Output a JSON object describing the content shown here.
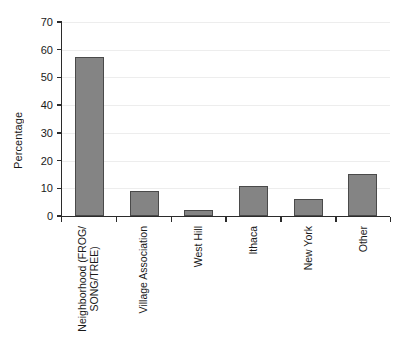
{
  "chart_data": {
    "type": "bar",
    "title": "",
    "xlabel": "",
    "ylabel": "Percentage",
    "ylim": [
      0,
      70
    ],
    "yticks": [
      0,
      10,
      20,
      30,
      40,
      50,
      60,
      70
    ],
    "grid": true,
    "legend": false,
    "bar_color": "#848484",
    "bar_edge_color": "#4a4a4a",
    "categories": [
      "Neighborhood (FROG/\nSONG/TREE)",
      "Village Association",
      "West Hill",
      "Ithaca",
      "New York",
      "Other"
    ],
    "values": [
      57.5,
      9,
      2,
      11,
      6,
      15
    ]
  }
}
